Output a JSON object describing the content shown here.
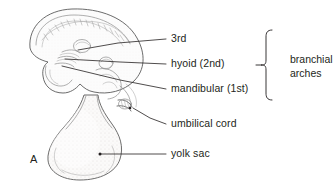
{
  "figure": {
    "panel_letter": "A",
    "background_color": "#ffffff",
    "ink_color": "#231f20",
    "line_color": "#5a5a5a"
  },
  "labels": [
    {
      "id": "third-arch",
      "text": "3rd",
      "text_x": 171,
      "text_y": 39,
      "leader": "M 166 39 L 118 43 L 78 50"
    },
    {
      "id": "hyoid-arch",
      "text": "hyoid (2nd)",
      "text_x": 171,
      "text_y": 64,
      "leader": "M 166 64 L 120 62 L 65 59"
    },
    {
      "id": "mandibular-arch",
      "text": "mandibular (1st)",
      "text_x": 171,
      "text_y": 89,
      "leader": "M 166 89 L 120 80 L 62 66"
    },
    {
      "id": "umbilical-cord",
      "text": "umbilical cord",
      "text_x": 171,
      "text_y": 124,
      "leader": "M 166 124 L 150 118 L 133 108"
    },
    {
      "id": "yolk-sac",
      "text": "yolk sac",
      "text_x": 171,
      "text_y": 154,
      "leader": "M 166 154 L 100 154"
    }
  ],
  "group_bracket": {
    "id": "branchial-arches",
    "line1": "branchial",
    "line2": "arches",
    "text_x": 290,
    "text_y_line1": 60,
    "text_y_line2": 74,
    "brace_top": 30,
    "brace_bottom": 100,
    "brace_x": 266,
    "brace_tip_x": 279,
    "brace_mid_y": 65
  },
  "anatomy": {
    "head_label": "cranial-region",
    "yolk_sac_label": "yolk-sac-body",
    "umbilical_label": "umbilical-cord-stub",
    "somite_label": "somite-row",
    "otic_label": "otic-vesicle",
    "optic_label": "optic-vesicle",
    "heart_label": "heart-bulge",
    "arch_groove_label": "branchial-groove"
  }
}
